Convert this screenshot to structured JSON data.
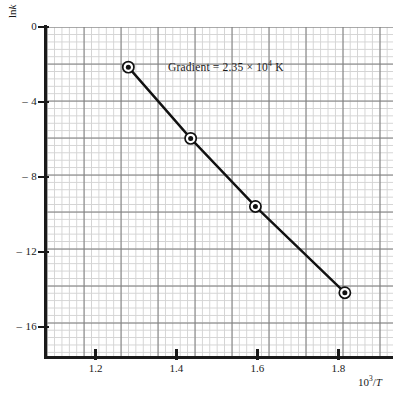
{
  "chart_data": {
    "type": "line",
    "title": "",
    "subtitle": "",
    "xlabel": "10³/T",
    "ylabel": "ln k",
    "xlabel_parts": {
      "mantissa": "10",
      "exponent": "3",
      "divider": "/",
      "variable": "T"
    },
    "ylabel_parts": {
      "prefix": "ln",
      "variable": "k"
    },
    "xlim": [
      1.08,
      1.935
    ],
    "ylim": [
      -17.6,
      0.0
    ],
    "xticks": [
      1.2,
      1.4,
      1.6,
      1.8
    ],
    "xtick_labels": [
      "1.2",
      "1.4",
      "1.6",
      "1.8"
    ],
    "yticks": [
      0,
      -4,
      -8,
      -12,
      -16
    ],
    "ytick_labels": [
      "0",
      "– 4",
      "– 8",
      "– 12",
      "– 16"
    ],
    "grid": true,
    "grid_style": "graph-paper",
    "minor_grid": true,
    "legend": false,
    "series": [
      {
        "name": "Arrhenius plot",
        "marker": "circle-with-dot",
        "line_color": "#111111",
        "x": [
          1.281,
          1.435,
          1.595,
          1.816
        ],
        "y": [
          -2.14,
          -5.94,
          -9.57,
          -14.17
        ]
      }
    ],
    "annotations": [
      {
        "name": "gradient-label",
        "text": "Gradient = 2.35 × 10⁴ K",
        "parts": {
          "label": "Gradient",
          "equals": "=",
          "coefficient": "2.35",
          "times": "×",
          "base": "10",
          "exponent": "4",
          "unit": "K"
        },
        "x": 1.33,
        "y": -2.1
      }
    ],
    "derived": {
      "gradient_value": 2.35,
      "gradient_exponent": 4,
      "gradient_units": "K"
    }
  }
}
